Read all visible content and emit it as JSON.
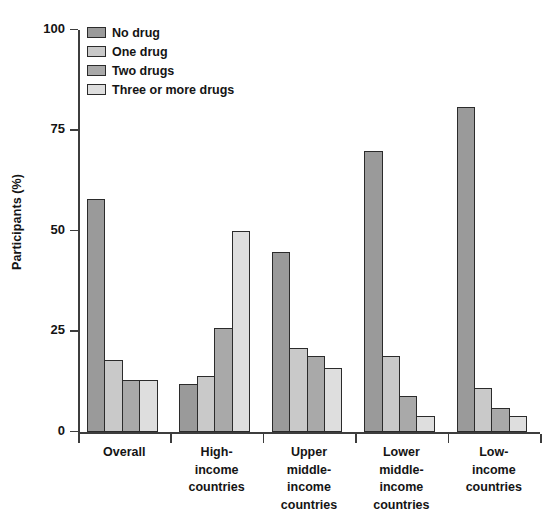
{
  "chart_data": {
    "type": "bar",
    "title": "",
    "xlabel": "",
    "ylabel": "Participants (%)",
    "ylim": [
      0,
      100
    ],
    "yticks": [
      0,
      25,
      50,
      75,
      100
    ],
    "ytick_labels": [
      "0",
      "25",
      "50",
      "75",
      "100"
    ],
    "grid": false,
    "legend_position": "top-left",
    "categories": [
      "Overall",
      "High-income countries",
      "Upper middle-income countries",
      "Lower middle-income countries",
      "Low-income countries"
    ],
    "category_lines": [
      [
        "Overall"
      ],
      [
        "High-",
        "income",
        "countries"
      ],
      [
        "Upper",
        "middle-",
        "income",
        "countries"
      ],
      [
        "Lower",
        "middle-",
        "income",
        "countries"
      ],
      [
        "Low-",
        "income",
        "countries"
      ]
    ],
    "series": [
      {
        "name": "No drug",
        "color": "#9a9a9a",
        "values": [
          58,
          12,
          45,
          70,
          81
        ]
      },
      {
        "name": "One drug",
        "color": "#c9c9c9",
        "values": [
          18,
          14,
          21,
          19,
          11
        ]
      },
      {
        "name": "Two drugs",
        "color": "#a9a9a9",
        "values": [
          13,
          26,
          19,
          9,
          6
        ]
      },
      {
        "name": "Three or more drugs",
        "color": "#dedede",
        "values": [
          13,
          50,
          16,
          4,
          4
        ]
      }
    ]
  },
  "legend": {
    "items": [
      {
        "label": "No drug",
        "color": "#9a9a9a"
      },
      {
        "label": "One drug",
        "color": "#c9c9c9"
      },
      {
        "label": "Two drugs",
        "color": "#a9a9a9"
      },
      {
        "label": "Three or more drugs",
        "color": "#dedede"
      }
    ]
  }
}
